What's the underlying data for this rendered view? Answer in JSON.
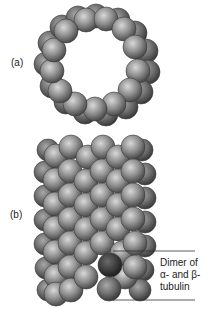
{
  "figure": {
    "panel_a_label": "(a)",
    "panel_b_label": "(b)",
    "callout": {
      "line1": "Dimer of",
      "line2": "α- and β-",
      "line3": "tubulin"
    },
    "colors": {
      "sphere": "#8a8a8a",
      "sphere_highlight": "#d9d9d9",
      "sphere_dark": "#3a3a3a",
      "dimer": "#4a4a4a",
      "line": "#333333"
    }
  }
}
